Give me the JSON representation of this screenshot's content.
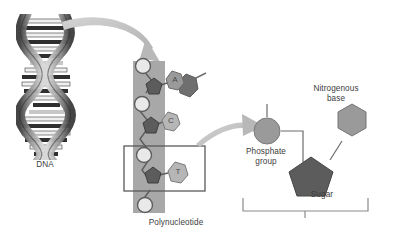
{
  "figure": {
    "background_color": "#ffffff"
  },
  "labels": {
    "dna": "DNA",
    "polynucleotide": "Polynucleotide",
    "nitrogenous_base": "Nitrogenous\nbase",
    "phosphate_group": "Phosphate\ngroup",
    "sugar": "Sugar",
    "nucleotide": "Nucleotide"
  },
  "polynucleotide": {
    "band_color": "#a8a8a8",
    "bases": [
      {
        "letter": "A",
        "paired": true
      },
      {
        "letter": "C",
        "paired": false
      },
      {
        "letter": "T",
        "paired": false
      }
    ],
    "highlight_box": {
      "stroke": "#5a5a5a"
    }
  },
  "nucleotide_detail": {
    "phosphate_color": "#9a9a9a",
    "sugar_color": "#5c5c5c",
    "base_color": "#9a9a9a",
    "connector_color": "#6b6b6b",
    "bracket_color": "#8a8a8a"
  },
  "arrows": {
    "color": "#bdbdbd",
    "helix_to_chain": "curved arrow from DNA helix to polynucleotide",
    "chain_to_nucleotide": "curved arrow from polynucleotide to nucleotide"
  },
  "helix": {
    "strand_dark": "#4a4a4a",
    "strand_light": "#c9c9c9",
    "rung_color": "#2e2e2e"
  }
}
